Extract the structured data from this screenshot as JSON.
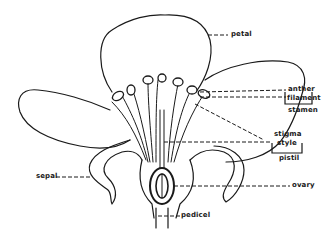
{
  "diagram": {
    "labels": {
      "petal": "petal",
      "anther": "anther",
      "filament": "filament",
      "stamen": "stamen",
      "stigma": "stigma",
      "style": "style",
      "pistil": "pistil",
      "sepal": "sepal",
      "ovary": "ovary",
      "pedicel": "pedicel"
    },
    "colors": {
      "ink": "#1a1a1a",
      "background": "#ffffff"
    }
  }
}
